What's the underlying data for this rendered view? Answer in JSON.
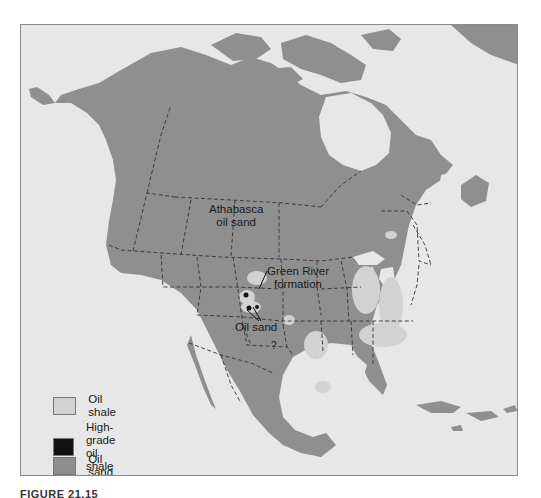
{
  "map": {
    "title": "North America oil shale and oil sand deposits",
    "colors": {
      "ocean": "#e7e7e7",
      "land": "#8f8f8f",
      "oil_shale": "#cfcfcf",
      "high_grade_oil_shale": "#111111",
      "oil_sand": "#8f8f8f",
      "border": "#333333"
    },
    "labels": {
      "athabasca": [
        "Athabasca",
        "oil sand"
      ],
      "green_river": [
        "Green River",
        "formation"
      ],
      "oil_sand": "Oil sand",
      "question": "?"
    }
  },
  "legend": {
    "items": [
      {
        "label": "Oil shale",
        "color": "#d2d2d2"
      },
      {
        "label_line1": "High-grade",
        "label_line2": "oil shale",
        "color": "#121212"
      },
      {
        "label": "Oil sand",
        "color": "#8e8e8e"
      }
    ]
  },
  "caption": "FIGURE 21.15"
}
